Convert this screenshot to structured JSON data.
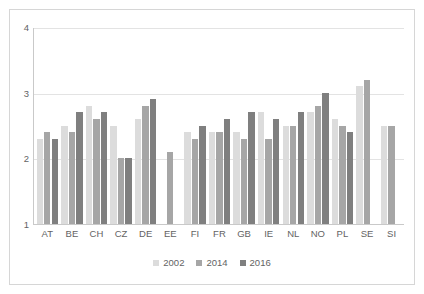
{
  "chart_data": {
    "type": "bar",
    "title": "",
    "subtitle": "",
    "xlabel": "",
    "ylabel": "",
    "ylim": [
      1,
      4
    ],
    "y_ticks": [
      "1",
      "2",
      "3",
      "4"
    ],
    "grid": true,
    "legend_position": "bottom",
    "categories": [
      "AT",
      "BE",
      "CH",
      "CZ",
      "DE",
      "EE",
      "FI",
      "FR",
      "GB",
      "IE",
      "NL",
      "NO",
      "PL",
      "SE",
      "SI"
    ],
    "series": [
      {
        "name": "2002",
        "color": "#dcdcdc",
        "values": [
          2.3,
          2.5,
          2.8,
          2.5,
          2.6,
          null,
          2.4,
          2.4,
          2.4,
          2.7,
          2.5,
          2.7,
          2.6,
          3.1,
          2.5
        ]
      },
      {
        "name": "2014",
        "color": "#a6a6a6",
        "values": [
          2.4,
          2.4,
          2.6,
          2.0,
          2.8,
          2.1,
          2.3,
          2.4,
          2.3,
          2.3,
          2.5,
          2.8,
          2.5,
          3.2,
          2.5
        ]
      },
      {
        "name": "2016",
        "color": "#7f7f7f",
        "values": [
          2.3,
          2.7,
          2.7,
          2.0,
          2.9,
          null,
          2.5,
          2.6,
          2.7,
          2.6,
          2.7,
          3.0,
          2.4,
          null,
          null
        ]
      }
    ]
  },
  "axis": {
    "y_tick_labels": [
      "4",
      "3",
      "2",
      "1"
    ],
    "y_tick_values": [
      4,
      3,
      2,
      1
    ]
  },
  "legend": {
    "items": [
      {
        "label": "2002",
        "color": "#dcdcdc"
      },
      {
        "label": "2014",
        "color": "#a6a6a6"
      },
      {
        "label": "2016",
        "color": "#7f7f7f"
      }
    ]
  },
  "colors": {
    "series_2002": "#dcdcdc",
    "series_2014": "#a6a6a6",
    "series_2016": "#7f7f7f",
    "gridline": "#e3e3e3",
    "axis": "#c9c9c9",
    "text": "#636363",
    "frame": "#d6d6d6",
    "background": "#ffffff"
  }
}
